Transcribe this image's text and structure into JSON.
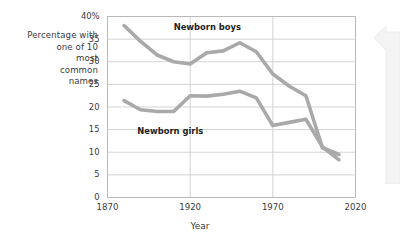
{
  "chart_data": {
    "type": "line",
    "title": "",
    "subtitle": "",
    "xlabel": "Year",
    "ylabel": "Percentage with one of 10 most common names",
    "ylabel_lines": [
      "Percentage with",
      "one of 10",
      "most",
      "common",
      "names"
    ],
    "xlim": [
      1870,
      2020
    ],
    "ylim": [
      0,
      40
    ],
    "grid": true,
    "gridlines": "horizontal",
    "legend_position": "inline-annotation",
    "x_ticks": [
      "1870",
      "1920",
      "1970",
      "2020"
    ],
    "x_tick_values": [
      1870,
      1920,
      1970,
      2020
    ],
    "y_ticks": [
      "0",
      "5",
      "10",
      "15",
      "20",
      "25",
      "30",
      "35",
      "40%"
    ],
    "y_tick_values": [
      0,
      5,
      10,
      15,
      20,
      25,
      30,
      35,
      40
    ],
    "series": [
      {
        "name": "Newborn boys",
        "color": "#a9a9a9",
        "label_x": 1910,
        "label_y": 37.4,
        "x": [
          1880,
          1890,
          1900,
          1910,
          1920,
          1930,
          1940,
          1950,
          1960,
          1970,
          1980,
          1990,
          2000,
          2010
        ],
        "values": [
          38.0,
          34.5,
          31.5,
          30.0,
          29.5,
          32.0,
          32.4,
          34.2,
          32.2,
          27.3,
          24.6,
          22.5,
          11.0,
          9.5
        ]
      },
      {
        "name": "Newborn girls",
        "color": "#a9a9a9",
        "label_x": 1888,
        "label_y": 14.4,
        "x": [
          1880,
          1890,
          1900,
          1910,
          1920,
          1930,
          1940,
          1950,
          1960,
          1970,
          1980,
          1990,
          2000,
          2010
        ],
        "values": [
          21.4,
          19.4,
          19.0,
          19.0,
          22.5,
          22.4,
          22.8,
          23.5,
          22.0,
          15.9,
          16.6,
          17.3,
          11.2,
          8.3
        ]
      }
    ]
  },
  "colors": {
    "line": "#a9a9a9",
    "grid": "#cfcfcf",
    "frame": "#b9b9b9",
    "text": "#3b3b3b",
    "callout": "#f2f2f2"
  },
  "callout": {
    "name": "left-arrow-banner"
  }
}
